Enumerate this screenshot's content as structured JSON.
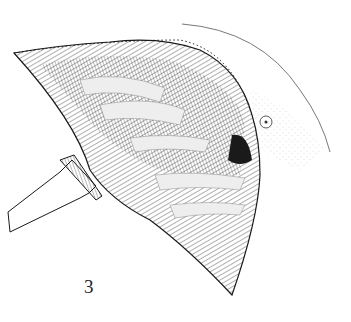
{
  "figure": {
    "label": "3",
    "colors": {
      "ink": "#1a1a1a",
      "background": "#ffffff",
      "stipple": "#9a9a9a"
    }
  }
}
